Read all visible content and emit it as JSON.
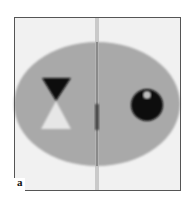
{
  "figure": {
    "panel_label": "a",
    "colors": {
      "background": "#f1f1f1",
      "frame": "#555555",
      "ellipse": "#a9a9a9",
      "dark_object": "#0a0a0a",
      "light_object": "#e6e6e6",
      "streak": "#7a7a7a",
      "highlight": "#bdbdbd"
    }
  }
}
